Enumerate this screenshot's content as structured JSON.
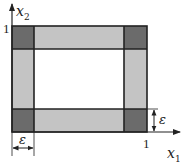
{
  "diagram": {
    "title": "",
    "axes": {
      "x": {
        "label": "x",
        "subscript": "1",
        "tick_label": "1"
      },
      "y": {
        "label": "x",
        "subscript": "2",
        "tick_label": "1"
      }
    },
    "dimensions": {
      "right_epsilon": "ε",
      "bottom_epsilon": "ε"
    },
    "regions": {
      "corner_squares": [
        "top-left",
        "top-right",
        "bottom-left",
        "bottom-right"
      ],
      "edge_strips": [
        "top",
        "bottom",
        "left",
        "right"
      ],
      "interior": "blank"
    },
    "colors": {
      "corner_fill": "#6b6b6b",
      "strip_fill": "#c4c4c4",
      "interior_fill": "#ffffff",
      "stroke": "#222222"
    }
  }
}
